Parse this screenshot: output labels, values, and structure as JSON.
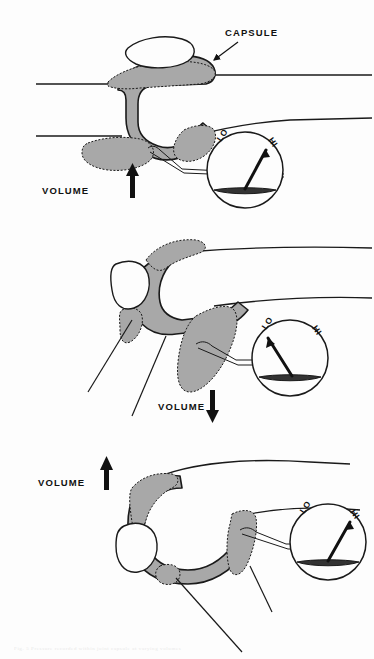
{
  "figure": {
    "background_color": "#fdfdfd",
    "ink_color": "#111111",
    "capsule_fill_color": "#a8a8a8",
    "capsule_outline_color": "#1a1a1a"
  },
  "labels": {
    "capsule": "CAPSULE",
    "volume": "VOLUME",
    "gauge_low": "LO",
    "gauge_high": "HI"
  },
  "panels": [
    {
      "id": "panel-1",
      "index": 1,
      "volume_label": "VOLUME",
      "volume_direction": "up",
      "volume_arrow_glyph": "↑",
      "gauge": {
        "low_label": "LO",
        "high_label": "HI",
        "needle_direction": "high",
        "needle_angle_deg": 55,
        "reading": "HI"
      },
      "callouts": [
        {
          "name": "capsule",
          "text": "CAPSULE"
        }
      ]
    },
    {
      "id": "panel-2",
      "index": 2,
      "volume_label": "VOLUME",
      "volume_direction": "down",
      "volume_arrow_glyph": "↓",
      "gauge": {
        "low_label": "LO",
        "high_label": "HI",
        "needle_direction": "low",
        "needle_angle_deg": 125,
        "reading": "LO"
      },
      "callouts": []
    },
    {
      "id": "panel-3",
      "index": 3,
      "volume_label": "VOLUME",
      "volume_direction": "up",
      "volume_arrow_glyph": "↑",
      "gauge": {
        "low_label": "LO",
        "high_label": "HI",
        "needle_direction": "high",
        "needle_angle_deg": 58,
        "reading": "HI"
      },
      "callouts": []
    }
  ],
  "footnote": {
    "text": "Fig. 5   Pressure recorded within joint capsule at varying volumes"
  }
}
